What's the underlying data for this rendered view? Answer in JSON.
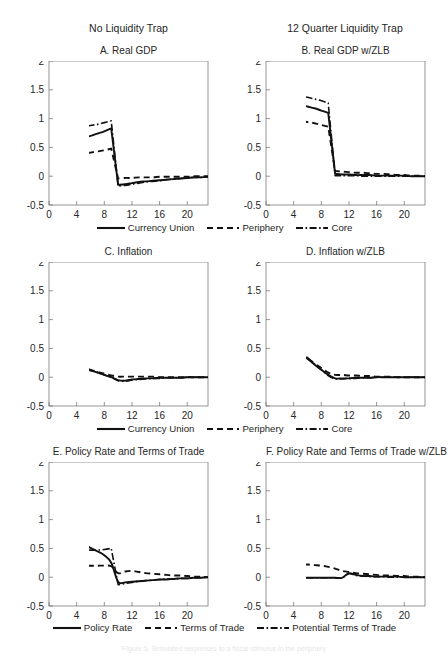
{
  "figure": {
    "column_headers": [
      "No Liquidity Trap",
      "12 Quarter Liquidity Trap"
    ],
    "caption": "Figure 5. Simulated responses to a fiscal stimulus in the periphery"
  },
  "axes": {
    "y_ticks": [
      "2",
      "1.5",
      "1",
      "0.5",
      "0",
      "-0.5"
    ],
    "y_values": [
      2,
      1.5,
      1,
      0.5,
      0,
      -0.5
    ],
    "x_ticks": [
      "0",
      "4",
      "8",
      "12",
      "16",
      "20"
    ],
    "x_values": [
      0,
      4,
      8,
      12,
      16,
      20
    ],
    "ylim": [
      -0.5,
      2
    ],
    "xlim": [
      0,
      23
    ]
  },
  "legends": {
    "gdp_inflation": [
      {
        "label": "Currency Union",
        "style": "solid"
      },
      {
        "label": "Periphery",
        "style": "dashed"
      },
      {
        "label": "Core",
        "style": "dashdot"
      }
    ],
    "policy": [
      {
        "label": "Policy Rate",
        "style": "solid"
      },
      {
        "label": "Terms of Trade",
        "style": "dashed"
      },
      {
        "label": "Potential Terms of Trade",
        "style": "dashdot"
      }
    ]
  },
  "chart_data": [
    {
      "id": "A",
      "type": "line",
      "title": "A. Real GDP",
      "column": "No Liquidity Trap",
      "xlabel": "",
      "ylabel": "",
      "ylim": [
        -0.5,
        2
      ],
      "xlim": [
        0,
        23
      ],
      "grid": false,
      "legend": "below-figure",
      "x": [
        0,
        1,
        2,
        3,
        4,
        5,
        6,
        7,
        8,
        9,
        10,
        11,
        12,
        13,
        14,
        15,
        16,
        17,
        18,
        19,
        20,
        21,
        22,
        23
      ],
      "series": [
        {
          "name": "Currency Union",
          "style": "solid",
          "values": [
            0.82,
            0.71,
            0.66,
            0.65,
            0.65,
            0.67,
            0.7,
            0.74,
            0.78,
            0.83,
            -0.15,
            -0.14,
            -0.12,
            -0.1,
            -0.09,
            -0.08,
            -0.07,
            -0.06,
            -0.05,
            -0.04,
            -0.03,
            -0.02,
            -0.02,
            -0.01
          ]
        },
        {
          "name": "Periphery",
          "style": "dashed",
          "values": [
            0.47,
            0.41,
            0.39,
            0.38,
            0.38,
            0.39,
            0.41,
            0.43,
            0.45,
            0.48,
            -0.04,
            -0.03,
            -0.03,
            -0.02,
            -0.02,
            -0.02,
            -0.01,
            -0.01,
            -0.01,
            -0.01,
            -0.01,
            0.0,
            0.0,
            0.0
          ]
        },
        {
          "name": "Core",
          "style": "dashdot",
          "values": [
            1.0,
            0.91,
            0.87,
            0.85,
            0.85,
            0.86,
            0.88,
            0.9,
            0.93,
            0.96,
            -0.17,
            -0.16,
            -0.14,
            -0.12,
            -0.1,
            -0.09,
            -0.08,
            -0.06,
            -0.05,
            -0.04,
            -0.03,
            -0.02,
            -0.02,
            -0.01
          ]
        }
      ]
    },
    {
      "id": "B",
      "type": "line",
      "title": "B. Real GDP w/ZLB",
      "column": "12 Quarter Liquidity Trap",
      "ylim": [
        -0.5,
        2
      ],
      "xlim": [
        0,
        23
      ],
      "grid": false,
      "x": [
        0,
        1,
        2,
        3,
        4,
        5,
        6,
        7,
        8,
        9,
        10,
        11,
        12,
        13,
        14,
        15,
        16,
        17,
        18,
        19,
        20,
        21,
        22,
        23
      ],
      "series": [
        {
          "name": "Currency Union",
          "style": "solid",
          "values": [
            1.15,
            1.24,
            1.27,
            1.27,
            1.26,
            1.24,
            1.21,
            1.18,
            1.14,
            1.1,
            0.04,
            0.03,
            0.03,
            0.02,
            0.02,
            0.02,
            0.01,
            0.01,
            0.01,
            0.01,
            0.01,
            0.0,
            0.0,
            0.0
          ]
        },
        {
          "name": "Periphery",
          "style": "dashed",
          "values": [
            0.78,
            0.9,
            0.95,
            0.97,
            0.97,
            0.96,
            0.94,
            0.92,
            0.89,
            0.86,
            0.09,
            0.08,
            0.07,
            0.06,
            0.06,
            0.05,
            0.04,
            0.04,
            0.03,
            0.02,
            0.02,
            0.01,
            0.01,
            0.0
          ]
        },
        {
          "name": "Core",
          "style": "dashdot",
          "values": [
            1.33,
            1.39,
            1.42,
            1.42,
            1.41,
            1.39,
            1.37,
            1.34,
            1.31,
            1.27,
            0.01,
            0.01,
            0.01,
            0.01,
            0.0,
            0.0,
            0.0,
            0.0,
            0.0,
            0.0,
            0.0,
            0.0,
            0.0,
            0.0
          ]
        }
      ]
    },
    {
      "id": "C",
      "type": "line",
      "title": "C. Inflation",
      "column": "No Liquidity Trap",
      "ylim": [
        -0.5,
        2
      ],
      "xlim": [
        0,
        23
      ],
      "grid": false,
      "x": [
        0,
        1,
        2,
        3,
        4,
        5,
        6,
        7,
        8,
        9,
        10,
        11,
        12,
        13,
        14,
        15,
        16,
        17,
        18,
        19,
        20,
        21,
        22,
        23
      ],
      "series": [
        {
          "name": "Currency Union",
          "style": "solid",
          "values": [
            0.32,
            0.29,
            0.26,
            0.23,
            0.2,
            0.16,
            0.12,
            0.08,
            0.04,
            0.0,
            -0.05,
            -0.06,
            -0.04,
            -0.03,
            -0.02,
            -0.02,
            -0.01,
            -0.01,
            -0.01,
            -0.01,
            0.0,
            0.0,
            0.0,
            0.0
          ]
        },
        {
          "name": "Periphery",
          "style": "dashed",
          "values": [
            0.17,
            0.17,
            0.17,
            0.17,
            0.17,
            0.15,
            0.12,
            0.09,
            0.06,
            0.03,
            0.01,
            0.01,
            0.01,
            0.01,
            0.01,
            0.01,
            0.0,
            0.0,
            0.0,
            0.0,
            0.0,
            0.0,
            0.0,
            0.0
          ]
        },
        {
          "name": "Core",
          "style": "dashdot",
          "values": [
            0.38,
            0.33,
            0.29,
            0.25,
            0.21,
            0.17,
            0.13,
            0.09,
            0.04,
            0.0,
            -0.06,
            -0.07,
            -0.05,
            -0.04,
            -0.03,
            -0.02,
            -0.02,
            -0.01,
            -0.01,
            -0.01,
            0.0,
            0.0,
            0.0,
            0.0
          ]
        }
      ]
    },
    {
      "id": "D",
      "type": "line",
      "title": "D. Inflation w/ZLB",
      "column": "12 Quarter Liquidity Trap",
      "ylim": [
        -0.5,
        2
      ],
      "xlim": [
        0,
        23
      ],
      "grid": false,
      "x": [
        0,
        1,
        2,
        3,
        4,
        5,
        6,
        7,
        8,
        9,
        10,
        11,
        12,
        13,
        14,
        15,
        16,
        17,
        18,
        19,
        20,
        21,
        22,
        23
      ],
      "series": [
        {
          "name": "Currency Union",
          "style": "solid",
          "values": [
            0.92,
            0.82,
            0.72,
            0.62,
            0.52,
            0.42,
            0.32,
            0.22,
            0.13,
            0.04,
            -0.02,
            -0.02,
            -0.02,
            -0.01,
            -0.01,
            -0.01,
            0.0,
            0.0,
            0.0,
            0.0,
            0.0,
            0.0,
            0.0,
            0.0
          ]
        },
        {
          "name": "Periphery",
          "style": "dashed",
          "values": [
            0.77,
            0.7,
            0.63,
            0.56,
            0.49,
            0.41,
            0.33,
            0.24,
            0.16,
            0.08,
            0.04,
            0.04,
            0.03,
            0.03,
            0.02,
            0.02,
            0.01,
            0.01,
            0.01,
            0.0,
            0.0,
            0.0,
            0.0,
            0.0
          ]
        },
        {
          "name": "Core",
          "style": "dashdot",
          "values": [
            0.98,
            0.87,
            0.76,
            0.65,
            0.55,
            0.44,
            0.34,
            0.23,
            0.13,
            0.03,
            -0.03,
            -0.03,
            -0.02,
            -0.02,
            -0.01,
            -0.01,
            0.0,
            0.0,
            0.0,
            0.0,
            0.0,
            0.0,
            0.0,
            0.0
          ]
        }
      ]
    },
    {
      "id": "E",
      "type": "line",
      "title": "E. Policy Rate and Terms of Trade",
      "column": "No Liquidity Trap",
      "ylim": [
        -0.5,
        2
      ],
      "xlim": [
        0,
        23
      ],
      "grid": false,
      "x": [
        0,
        1,
        2,
        3,
        4,
        5,
        6,
        7,
        8,
        9,
        10,
        11,
        12,
        13,
        14,
        15,
        16,
        17,
        18,
        19,
        20,
        21,
        22,
        23
      ],
      "series": [
        {
          "name": "Policy Rate",
          "style": "solid",
          "values": [
            0.9,
            0.82,
            0.75,
            0.69,
            0.63,
            0.57,
            0.51,
            0.45,
            0.38,
            0.25,
            -0.08,
            -0.09,
            -0.08,
            -0.07,
            -0.06,
            -0.05,
            -0.04,
            -0.04,
            -0.03,
            -0.02,
            -0.02,
            -0.01,
            -0.01,
            0.0
          ]
        },
        {
          "name": "Terms of Trade",
          "style": "dashed",
          "values": [
            0.08,
            0.14,
            0.17,
            0.19,
            0.2,
            0.2,
            0.2,
            0.2,
            0.2,
            0.19,
            0.07,
            0.1,
            0.11,
            0.09,
            0.07,
            0.06,
            0.05,
            0.04,
            0.03,
            0.03,
            0.02,
            0.01,
            0.01,
            0.0
          ]
        },
        {
          "name": "Potential Terms of Trade",
          "style": "dashdot",
          "values": [
            0.6,
            0.56,
            0.53,
            0.51,
            0.49,
            0.48,
            0.47,
            0.47,
            0.48,
            0.5,
            -0.13,
            -0.11,
            -0.09,
            -0.07,
            -0.06,
            -0.05,
            -0.04,
            -0.03,
            -0.03,
            -0.02,
            -0.02,
            -0.01,
            -0.01,
            0.0
          ]
        }
      ]
    },
    {
      "id": "F",
      "type": "line",
      "title": "F. Policy Rate and Terms of Trade w/ZLB",
      "column": "12 Quarter Liquidity Trap",
      "ylim": [
        -0.5,
        2
      ],
      "xlim": [
        0,
        23
      ],
      "grid": false,
      "x": [
        0,
        1,
        2,
        3,
        4,
        5,
        6,
        7,
        8,
        9,
        10,
        11,
        12,
        13,
        14,
        15,
        16,
        17,
        18,
        19,
        20,
        21,
        22,
        23
      ],
      "series": [
        {
          "name": "Policy Rate",
          "style": "solid",
          "values": [
            -0.01,
            -0.01,
            -0.01,
            -0.01,
            -0.01,
            -0.01,
            -0.01,
            -0.01,
            -0.01,
            -0.01,
            -0.01,
            -0.01,
            0.07,
            0.04,
            0.02,
            0.02,
            0.01,
            0.01,
            0.01,
            0.01,
            0.0,
            0.0,
            0.0,
            0.0
          ]
        },
        {
          "name": "Terms of Trade",
          "style": "dashed",
          "values": [
            0.05,
            0.13,
            0.18,
            0.2,
            0.21,
            0.22,
            0.22,
            0.21,
            0.2,
            0.18,
            0.15,
            0.11,
            0.09,
            0.07,
            0.06,
            0.05,
            0.04,
            0.03,
            0.03,
            0.02,
            0.02,
            0.01,
            0.01,
            0.0
          ]
        },
        {
          "name": "Potential Terms of Trade",
          "style": "dashdot",
          "values": [
            -0.01,
            -0.01,
            -0.01,
            -0.01,
            -0.01,
            -0.01,
            -0.01,
            -0.01,
            -0.01,
            -0.01,
            -0.01,
            -0.01,
            0.06,
            0.03,
            0.02,
            0.01,
            0.01,
            0.01,
            0.0,
            0.0,
            0.0,
            0.0,
            0.0,
            0.0
          ]
        }
      ]
    }
  ]
}
